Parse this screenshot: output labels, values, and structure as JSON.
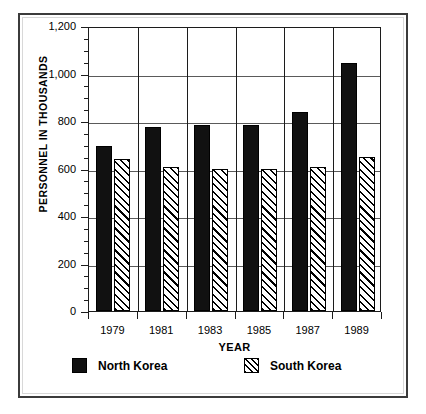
{
  "chart_data": {
    "type": "bar",
    "title": "",
    "xlabel": "YEAR",
    "ylabel": "PERSONNEL IN THOUSANDS",
    "categories": [
      "1979",
      "1981",
      "1983",
      "1985",
      "1987",
      "1989"
    ],
    "series": [
      {
        "name": "North Korea",
        "pattern": "solid-black",
        "values": [
          695,
          775,
          785,
          785,
          840,
          1045
        ]
      },
      {
        "name": "South Korea",
        "pattern": "diagonal-hatch",
        "values": [
          640,
          605,
          600,
          598,
          605,
          650
        ]
      }
    ],
    "ylim": [
      0,
      1200
    ],
    "ytick_labels": [
      "0",
      "200",
      "400",
      "600",
      "800",
      "1,000",
      "1,200"
    ],
    "ytick_values": [
      0,
      200,
      400,
      600,
      800,
      1000,
      1200
    ],
    "yminor_step": 50,
    "grid": "horizontal-and-vertical",
    "legend_position": "bottom",
    "legend": [
      {
        "label": "North Korea",
        "swatch": "solid-black"
      },
      {
        "label": "South Korea",
        "swatch": "diagonal-hatch"
      }
    ]
  },
  "colors": {
    "series_north": "#111111",
    "series_south": "#ffffff",
    "hatch_line": "#000000",
    "axis": "#1c1c1c",
    "grid": "#5a5a5a",
    "frame": "#3b3b3b",
    "background": "#ffffff"
  }
}
